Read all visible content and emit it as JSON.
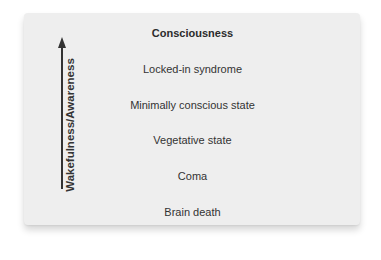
{
  "diagram": {
    "type": "vertical-scale",
    "axis": {
      "label": "Wakefulness/Awareness",
      "direction": "up",
      "icon": "arrow-up-icon"
    },
    "levels": [
      {
        "label": "Consciousness",
        "emphasis": "bold"
      },
      {
        "label": "Locked-in syndrome",
        "emphasis": "normal"
      },
      {
        "label": "Minimally conscious state",
        "emphasis": "normal"
      },
      {
        "label": "Vegetative state",
        "emphasis": "normal"
      },
      {
        "label": "Coma",
        "emphasis": "normal"
      },
      {
        "label": "Brain death",
        "emphasis": "normal"
      }
    ],
    "colors": {
      "panel_background": "#eeeeee",
      "text": "#333333",
      "arrow": "#333333",
      "page_background": "#ffffff"
    }
  }
}
